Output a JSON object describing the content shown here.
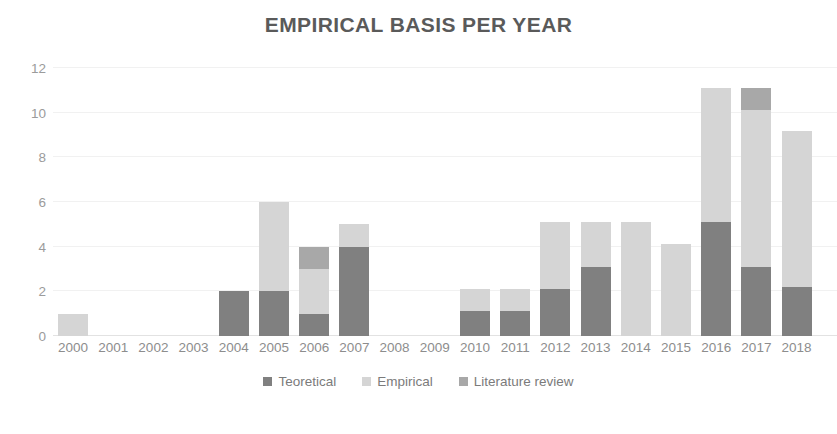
{
  "chart_data": {
    "type": "bar",
    "title": "EMPIRICAL BASIS PER YEAR",
    "subtitle": "",
    "xlabel": "",
    "ylabel": "",
    "ylim": [
      0,
      12
    ],
    "yticks": [
      0,
      2,
      4,
      6,
      8,
      10,
      12
    ],
    "ytick_labels": [
      "0",
      "2",
      "4",
      "6",
      "8",
      "10",
      "12"
    ],
    "grid": true,
    "grid_axis": "y",
    "stacked": true,
    "legend_position": "bottom",
    "categories": [
      "2000",
      "2001",
      "2002",
      "2003",
      "2004",
      "2005",
      "2006",
      "2007",
      "2008",
      "2009",
      "2010",
      "2011",
      "2012",
      "2013",
      "2014",
      "2015",
      "2016",
      "2017",
      "2018"
    ],
    "series": [
      {
        "name": "Teoretical",
        "color": "#808080",
        "values": [
          0,
          0,
          0,
          0,
          2,
          2,
          1,
          4,
          0,
          0,
          1.1,
          1.1,
          2.1,
          3.1,
          0,
          0,
          5.1,
          3.1,
          2.2
        ]
      },
      {
        "name": "Empirical",
        "color": "#d5d5d5",
        "values": [
          1,
          0,
          0,
          0,
          0,
          4,
          2,
          1,
          0,
          0,
          1,
          1,
          3,
          2,
          5.1,
          4.1,
          6,
          7,
          7
        ]
      },
      {
        "name": "Literature review",
        "color": "#a8a8a8",
        "values": [
          0,
          0,
          0,
          0,
          0,
          0,
          1,
          0,
          0,
          0,
          0,
          0,
          0,
          0,
          0,
          0,
          0,
          1,
          0
        ]
      }
    ],
    "totals": [
      1,
      0,
      0,
      0,
      2,
      6,
      4,
      5,
      0,
      0,
      2.1,
      2.1,
      5.1,
      5.1,
      5.1,
      4.1,
      11.1,
      11.1,
      9.2
    ]
  },
  "legend": {
    "items": [
      {
        "label": "Teoretical",
        "color": "#808080",
        "swatch_icon": "square-swatch-icon"
      },
      {
        "label": "Empirical",
        "color": "#d5d5d5",
        "swatch_icon": "square-swatch-icon"
      },
      {
        "label": "Literature review",
        "color": "#a8a8a8",
        "swatch_icon": "square-swatch-icon"
      }
    ]
  },
  "style": {
    "title_color": "#5a5a5a",
    "tick_color": "#8d8d8d",
    "gridline_color": "#f1f1f1",
    "background": "#ffffff"
  }
}
